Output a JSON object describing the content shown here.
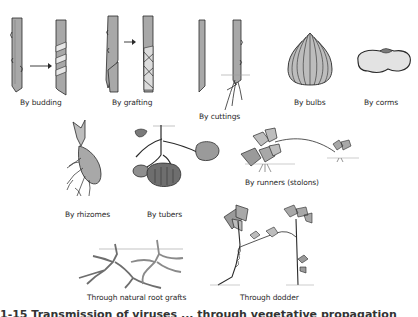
{
  "figure": {
    "panels": [
      {
        "id": "budding",
        "label": "By budding"
      },
      {
        "id": "grafting",
        "label": "By grafting"
      },
      {
        "id": "cuttings",
        "label": "By cuttings"
      },
      {
        "id": "bulbs",
        "label": "By bulbs"
      },
      {
        "id": "corms",
        "label": "By corms"
      },
      {
        "id": "rhizomes",
        "label": "By rhizomes"
      },
      {
        "id": "tubers",
        "label": "By tubers"
      },
      {
        "id": "runners",
        "label": "By runners (stolons)"
      },
      {
        "id": "root_grafts",
        "label": "Through natural root grafts"
      },
      {
        "id": "dodder",
        "label": "Through dodder"
      }
    ],
    "caption_partial": "1-15  Transmission of viruses ... through vegetative propagation"
  },
  "colors": {
    "ink": "#2a2a2a",
    "fill_light": "#d9d9d9",
    "fill_mid": "#a8a8a8",
    "fill_dark": "#6e6e6e",
    "background": "#ffffff"
  }
}
